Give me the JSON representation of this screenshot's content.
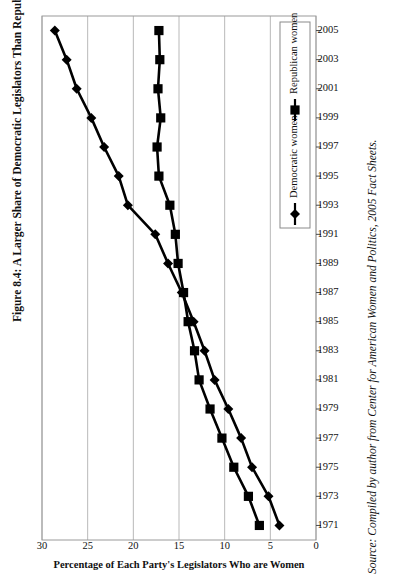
{
  "figure": {
    "title": "Figure 8.4: A Larger Share of Democratic Legislators Than Republican Legislators Are Women.",
    "source": "Source: Compiled by author from Center for American Women and Politics, 2005 Fact Sheets."
  },
  "chart_data": {
    "type": "line",
    "title": "",
    "orientation": "rotated-90",
    "xlabel": "",
    "ylabel": "Percentage of Each Party's Legislators Who are Women",
    "xlim": [
      1970,
      2006
    ],
    "ylim": [
      0,
      30
    ],
    "yticks": [
      0,
      5,
      10,
      15,
      20,
      25,
      30
    ],
    "grid": "vertical-only",
    "legend_position": "bottom-right",
    "x": [
      1971,
      1973,
      1975,
      1977,
      1979,
      1981,
      1983,
      1985,
      1987,
      1989,
      1991,
      1993,
      1995,
      1997,
      1999,
      2001,
      2003,
      2005
    ],
    "xticklabels": [
      "1971",
      "1973",
      "1975",
      "1977",
      "1979",
      "1981",
      "1983",
      "1985",
      "1987",
      "1989",
      "1991",
      "1993",
      "1995",
      "1997",
      "1999",
      "2001",
      "2003",
      "2005"
    ],
    "series": [
      {
        "name": "Democratic women",
        "marker": "diamond",
        "values": [
          4.0,
          5.2,
          7.0,
          8.2,
          9.6,
          11.1,
          12.2,
          13.4,
          14.7,
          16.2,
          17.6,
          20.6,
          21.6,
          23.2,
          24.6,
          26.2,
          27.3,
          28.6
        ]
      },
      {
        "name": "Republican women",
        "marker": "square",
        "values": [
          6.2,
          7.4,
          9.0,
          10.3,
          11.6,
          12.8,
          13.3,
          14.0,
          14.5,
          15.1,
          15.4,
          16.0,
          17.2,
          17.4,
          17.0,
          17.3,
          17.1,
          17.2
        ]
      }
    ],
    "legend": [
      {
        "label": "Democratic women",
        "marker": "diamond",
        "color": "#000000"
      },
      {
        "label": "Republican women",
        "marker": "square",
        "color": "#000000"
      }
    ]
  }
}
